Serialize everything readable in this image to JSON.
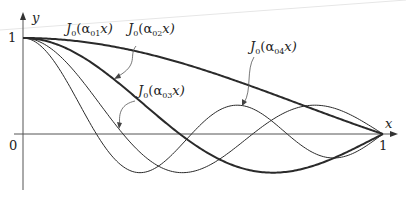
{
  "figure": {
    "axes": {
      "x_label": "x",
      "y_label": "y",
      "origin_label": "0",
      "x_tick_label": "1",
      "y_tick_label": "1"
    },
    "curves": [
      {
        "id": "n1",
        "label_main": "J",
        "label_sub0": "0",
        "label_paren": "(α",
        "label_sub": "01",
        "label_end": "x)",
        "zero": 2.405,
        "weight": 2.0
      },
      {
        "id": "n2",
        "label_main": "J",
        "label_sub0": "0",
        "label_paren": "(α",
        "label_sub": "02",
        "label_end": "x)",
        "zero": 5.52,
        "weight": 2.0
      },
      {
        "id": "n3",
        "label_main": "J",
        "label_sub0": "0",
        "label_paren": "(α",
        "label_sub": "03",
        "label_end": "x)",
        "zero": 8.654,
        "weight": 1.0
      },
      {
        "id": "n4",
        "label_main": "J",
        "label_sub0": "0",
        "label_paren": "(α",
        "label_sub": "04",
        "label_end": "x)",
        "zero": 11.792,
        "weight": 1.0
      }
    ],
    "colors": {
      "curve": "#2a2a2a",
      "axis": "#555555",
      "bg": "#ffffff"
    }
  }
}
